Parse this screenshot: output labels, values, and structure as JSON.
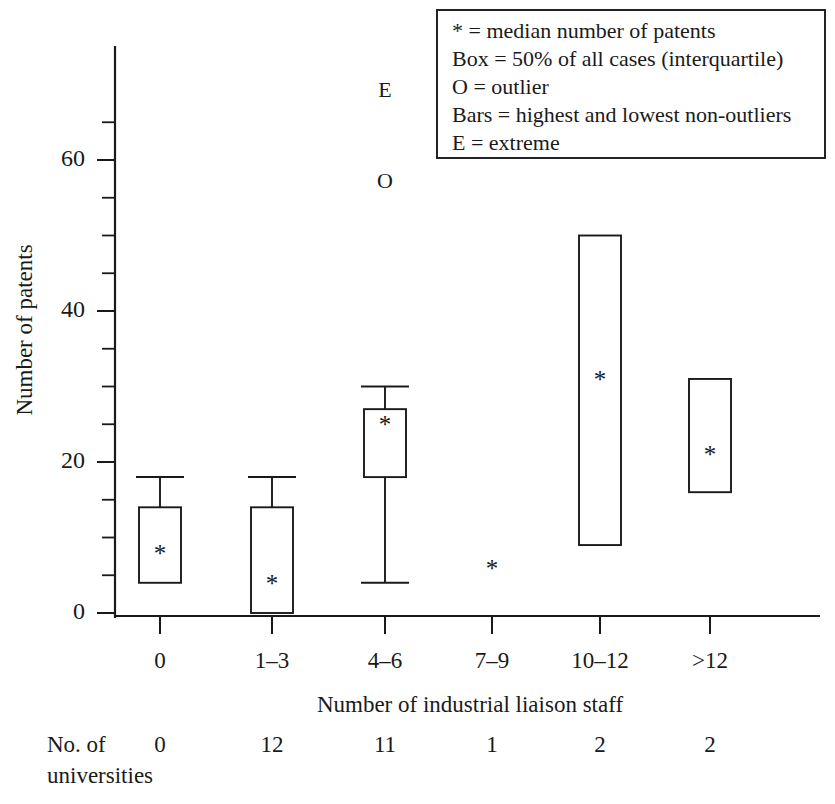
{
  "chart_data": {
    "type": "box",
    "title": "",
    "xlabel": "Number of industrial liaison staff",
    "ylabel": "Number of patents",
    "ylim": [
      0,
      66
    ],
    "yticks": [
      0,
      20,
      40,
      60
    ],
    "ytick_labels": [
      "0",
      "20",
      "40",
      "60"
    ],
    "y_minor_step": 5,
    "grid": false,
    "categories": [
      "0",
      "1–3",
      "4–6",
      "7–9",
      "10–12",
      ">12"
    ],
    "secondary_axis": {
      "label_line1": "No. of",
      "label_line2": "universities",
      "values": [
        "0",
        "12",
        "11",
        "1",
        "2",
        "2"
      ]
    },
    "boxes": [
      {
        "category": "0",
        "whisker_high": 18,
        "q3": 14,
        "median": 8,
        "q1": 4,
        "whisker_low": null,
        "outliers": [],
        "extremes": []
      },
      {
        "category": "1–3",
        "whisker_high": 18,
        "q3": 14,
        "median": 4,
        "q1": 0,
        "whisker_low": null,
        "outliers": [],
        "extremes": []
      },
      {
        "category": "4–6",
        "whisker_high": 30,
        "q3": 27,
        "median": 25,
        "q1": 18,
        "whisker_low": 4,
        "outliers": [
          57
        ],
        "extremes": [
          69
        ]
      },
      {
        "category": "7–9",
        "whisker_high": null,
        "q3": null,
        "median": 6,
        "q1": null,
        "whisker_low": null,
        "outliers": [],
        "extremes": []
      },
      {
        "category": "10–12",
        "whisker_high": null,
        "q3": 50,
        "median": 31,
        "q1": 9,
        "whisker_low": null,
        "outliers": [],
        "extremes": []
      },
      {
        "category": ">12",
        "whisker_high": null,
        "q3": 31,
        "median": 21,
        "q1": 16,
        "whisker_low": null,
        "outliers": [],
        "extremes": []
      }
    ],
    "legend": {
      "position": "top-right",
      "entries": [
        "* = median number of patents",
        "Box = 50% of all cases (interquartile)",
        "O = outlier",
        "Bars = highest and lowest non-outliers",
        "E = extreme"
      ]
    },
    "markers": {
      "median_glyph": "*",
      "outlier_glyph": "O",
      "extreme_glyph": "E"
    },
    "colors": {
      "ink": "#1a1a1a",
      "box_fill": "#ffffff",
      "background": "#ffffff"
    }
  }
}
